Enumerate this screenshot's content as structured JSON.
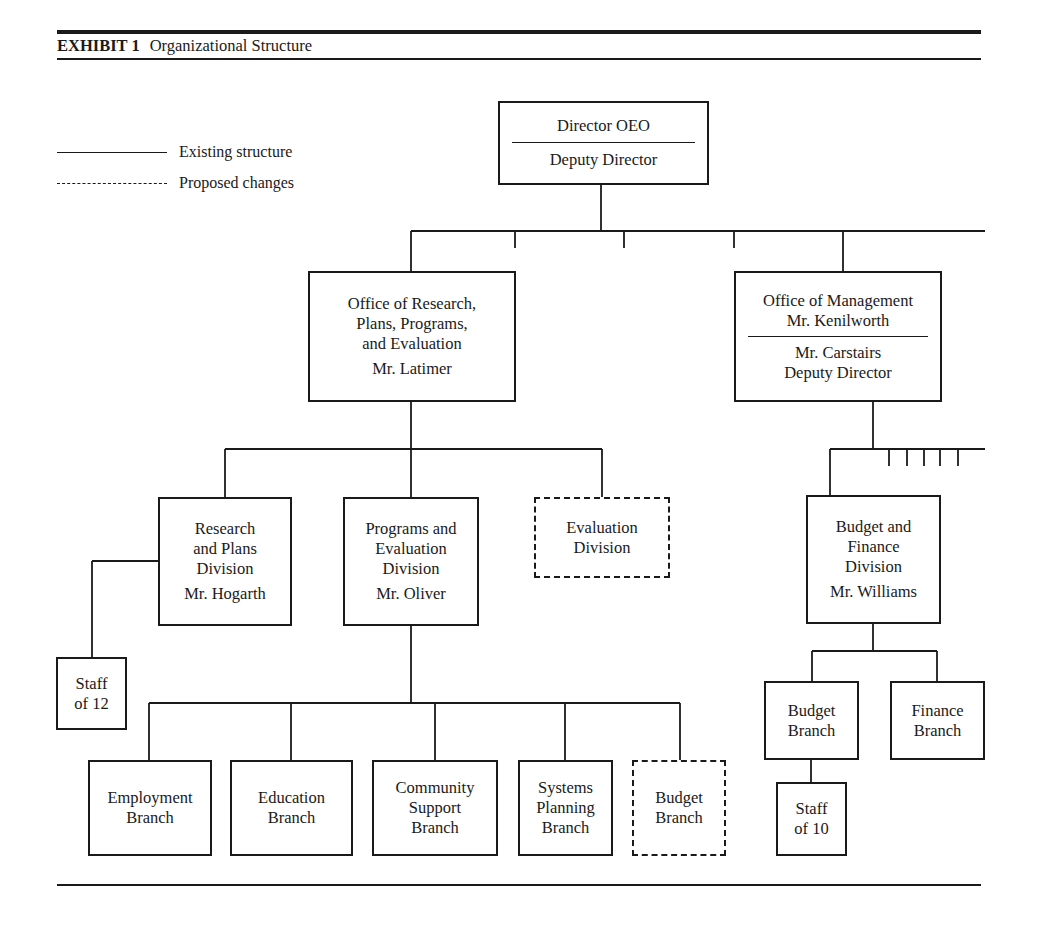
{
  "header": {
    "exhibit_label": "EXHIBIT 1",
    "title": "Organizational Structure"
  },
  "legend": {
    "existing": "Existing structure",
    "proposed": "Proposed changes"
  },
  "nodes": {
    "director": {
      "title": "Director OEO",
      "deputy": "Deputy Director"
    },
    "research_office": {
      "lines": [
        "Office of Research,",
        "Plans, Programs,",
        "and Evaluation"
      ],
      "head": "Mr. Latimer"
    },
    "management_office": {
      "lines": [
        "Office of Management",
        "Mr. Kenilworth"
      ],
      "deputy_lines": [
        "Mr. Carstairs",
        "Deputy Director"
      ]
    },
    "research_plans": {
      "lines": [
        "Research",
        "and Plans",
        "Division"
      ],
      "head": "Mr. Hogarth"
    },
    "programs_eval": {
      "lines": [
        "Programs and",
        "Evaluation",
        "Division"
      ],
      "head": "Mr. Oliver"
    },
    "evaluation_div": {
      "lines": [
        "Evaluation",
        "Division"
      ],
      "status": "proposed"
    },
    "staff12": {
      "lines": [
        "Staff",
        "of 12"
      ]
    },
    "budget_finance": {
      "lines": [
        "Budget and",
        "Finance",
        "Division"
      ],
      "head": "Mr. Williams"
    },
    "employment": {
      "lines": [
        "Employment",
        "Branch"
      ]
    },
    "education": {
      "lines": [
        "Education",
        "Branch"
      ]
    },
    "community": {
      "lines": [
        "Community",
        "Support",
        "Branch"
      ]
    },
    "systems": {
      "lines": [
        "Systems",
        "Planning",
        "Branch"
      ]
    },
    "budget_branch_proposed": {
      "lines": [
        "Budget",
        "Branch"
      ],
      "status": "proposed"
    },
    "budget_branch": {
      "lines": [
        "Budget",
        "Branch"
      ]
    },
    "finance_branch": {
      "lines": [
        "Finance",
        "Branch"
      ]
    },
    "staff10": {
      "lines": [
        "Staff",
        "of 10"
      ]
    }
  }
}
